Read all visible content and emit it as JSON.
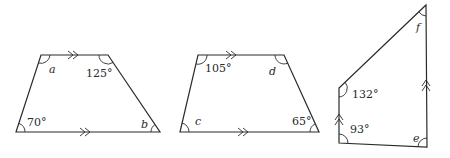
{
  "figure": {
    "shapes": [
      {
        "id": "trapezium-1",
        "angles": [
          {
            "label": "a",
            "value": null
          },
          {
            "label": "125°",
            "value": 125
          },
          {
            "label": "70°",
            "value": 70
          },
          {
            "label": "b",
            "value": null
          }
        ]
      },
      {
        "id": "trapezium-2",
        "angles": [
          {
            "label": "105°",
            "value": 105
          },
          {
            "label": "d",
            "value": null
          },
          {
            "label": "c",
            "value": null
          },
          {
            "label": "65°",
            "value": 65
          }
        ]
      },
      {
        "id": "trapezium-3",
        "angles": [
          {
            "label": "f",
            "value": null
          },
          {
            "label": "132°",
            "value": 132
          },
          {
            "label": "93°",
            "value": 93
          },
          {
            "label": "e",
            "value": null
          }
        ]
      }
    ]
  }
}
